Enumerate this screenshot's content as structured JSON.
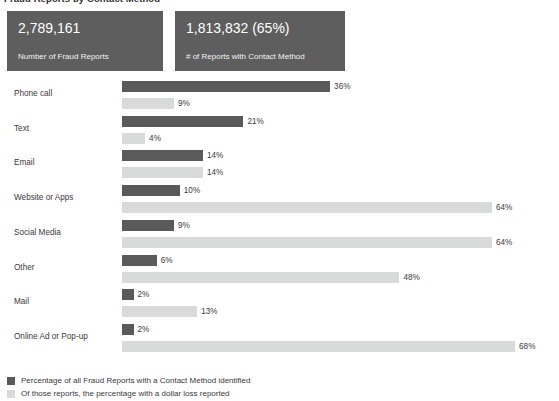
{
  "title": "Fraud Reports by Contact Method",
  "kpi_cards": [
    {
      "id": "total-fraud-reports",
      "value": "2,789,161",
      "label": "Number of Fraud Reports"
    },
    {
      "id": "reports-with-contact-method",
      "value": "1,813,832 (65%)",
      "label": "# of Reports with Contact Method"
    }
  ],
  "legend": [
    {
      "swatch": "dark",
      "label": "Percentage of all Fraud Reports with a Contact Method identified"
    },
    {
      "swatch": "light",
      "label": "Of those reports, the percentage with a dollar loss reported"
    }
  ],
  "chart_data": {
    "type": "bar",
    "title": "Fraud Reports by Contact Method",
    "orientation": "horizontal",
    "grid": false,
    "legend_position": "bottom-left",
    "xlabel": "",
    "ylabel": "",
    "xlim": [
      0,
      68
    ],
    "categories": [
      "Phone call",
      "Text",
      "Email",
      "Website or Apps",
      "Social Media",
      "Other",
      "Mail",
      "Online Ad or Pop-up"
    ],
    "series": [
      {
        "name": "Percentage of all Fraud Reports with a Contact Method identified",
        "color": "#5a5a5a",
        "values": [
          36,
          21,
          14,
          10,
          9,
          6,
          2,
          2
        ],
        "labels": [
          "36%",
          "21%",
          "14%",
          "10%",
          "9%",
          "6%",
          "2%",
          "2%"
        ]
      },
      {
        "name": "Of those reports, the percentage with a dollar loss reported",
        "color": "#d9dada",
        "values": [
          9,
          4,
          14,
          64,
          64,
          48,
          13,
          68
        ],
        "labels": [
          "9%",
          "4%",
          "14%",
          "64%",
          "64%",
          "48%",
          "13%",
          "68%"
        ]
      }
    ]
  }
}
